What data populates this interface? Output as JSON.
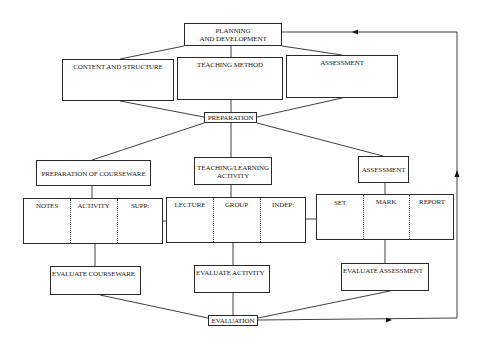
{
  "diagram": {
    "top": {
      "planning": "PLANNING\nAND DEVELOPMENT",
      "planning_line1": "PLANNING",
      "planning_line2": "AND DEVELOPMENT"
    },
    "planning_children": [
      {
        "label": "CONTENT AND STRUCTURE"
      },
      {
        "label": "TEACHING METHOD"
      },
      {
        "label": "ASSESSMENT"
      }
    ],
    "preparation": "PREPARATION",
    "branches": [
      {
        "label": "PREPARATION OF COURSEWARE",
        "columns": [
          "NOTES",
          "ACTIVITY",
          "SUPP:"
        ],
        "evaluate": "EVALUATE COURSEWARE"
      },
      {
        "label_line1": "TEACHING/LEARNING",
        "label_line2": "ACTIVITY",
        "columns": [
          "LECTURE",
          "GROUP",
          "INDEP:"
        ],
        "evaluate": "EVALUATE ACTIVITY"
      },
      {
        "label": "ASSESSMENT",
        "columns": [
          "SET",
          "MARK",
          "REPORT"
        ],
        "evaluate": "EVALUATE ASSESSMENT"
      }
    ],
    "evaluation": "EVALUATION",
    "feedback_loop": "EVALUATION back to PLANNING AND DEVELOPMENT"
  }
}
